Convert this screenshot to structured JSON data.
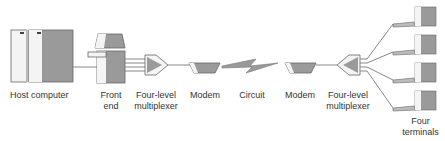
{
  "diagram": {
    "labels": {
      "host_computer": "Host computer",
      "front_end_1": "Front",
      "front_end_2": "end",
      "mux_left_1": "Four-level",
      "mux_left_2": "multiplexer",
      "modem_left": "Modem",
      "circuit": "Circuit",
      "modem_right": "Modem",
      "mux_right_1": "Four-level",
      "mux_right_2": "multiplexer",
      "terminals_1": "Four",
      "terminals_2": "terminals"
    },
    "colors": {
      "line": "#888888",
      "fill_dark": "#9a9a9a",
      "fill_light": "#f4f4f4",
      "outline": "#666666"
    },
    "terminal_count": 4
  }
}
